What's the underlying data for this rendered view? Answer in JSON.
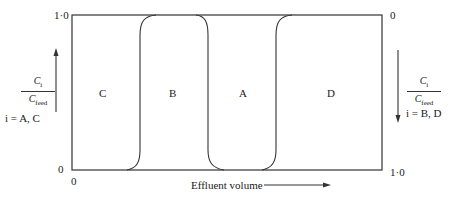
{
  "diagram": {
    "type": "chromatogram-elution-profile",
    "left_axis": {
      "top_tick": "1·0",
      "bottom_tick": "0",
      "numerator": "C",
      "numerator_sub": "i",
      "denominator": "C",
      "denominator_sub": "feed",
      "species": "i = A, C",
      "arrow_direction": "up"
    },
    "right_axis": {
      "top_tick": "0",
      "bottom_tick": "1·0",
      "numerator": "C",
      "numerator_sub": "i",
      "denominator": "C",
      "denominator_sub": "feed",
      "species": "i = B, D",
      "arrow_direction": "down"
    },
    "x_axis": {
      "origin_label": "0",
      "label": "Effluent volume",
      "arrow_direction": "right"
    },
    "regions": [
      {
        "label": "C"
      },
      {
        "label": "B"
      },
      {
        "label": "A"
      },
      {
        "label": "D"
      }
    ],
    "colors": {
      "line": "#333333",
      "text": "#1a1a1a",
      "background": "#ffffff"
    }
  }
}
